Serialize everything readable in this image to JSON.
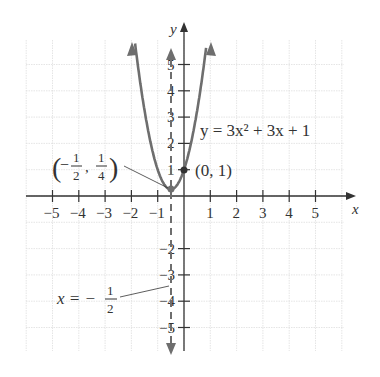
{
  "chart_data": {
    "type": "line",
    "title": "",
    "equation_label": "y = 3x² + 3x + 1",
    "xlabel": "x",
    "ylabel": "y",
    "xlim": [
      -6,
      6
    ],
    "ylim": [
      -6,
      6
    ],
    "grid": true,
    "x_ticks": [
      "-5",
      "-4",
      "-3",
      "-2",
      "-1",
      "1",
      "2",
      "3",
      "4",
      "5"
    ],
    "y_ticks": [
      "5",
      "4",
      "3",
      "2",
      "1",
      "-2",
      "-3",
      "-4",
      "-5"
    ],
    "series": [
      {
        "name": "y = 3x^2 + 3x + 1",
        "x": [
          -1.9,
          -1.5,
          -1,
          -0.5,
          0,
          0.5,
          0.9
        ],
        "y": [
          6.13,
          3.25,
          1,
          0.25,
          1,
          2.75,
          6.13
        ]
      }
    ],
    "annotations": [
      {
        "text": "(−1/2, 1/4)",
        "point": [
          -0.5,
          0.25
        ],
        "label": "vertex"
      },
      {
        "text": "(0, 1)",
        "point": [
          0,
          1
        ],
        "label": "y-intercept"
      },
      {
        "text": "x = −1/2",
        "label": "axis of symmetry",
        "style": "dashed"
      }
    ]
  },
  "labels": {
    "x_axis": "x",
    "y_axis": "y",
    "equation": "y = 3x² + 3x + 1",
    "vertex": "(0, 1)",
    "axis_sym_lhs": "x = −",
    "frac_num": "1",
    "frac_den": "2",
    "vertex_frac_n1": "1",
    "vertex_frac_d1": "2",
    "vertex_frac_n2": "1",
    "vertex_frac_d2": "4"
  },
  "colors": {
    "curve": "#6e6e6e",
    "axis": "#333333",
    "grid": "#dcdcdc"
  }
}
